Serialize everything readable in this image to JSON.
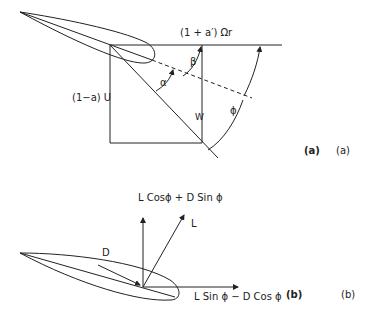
{
  "figure": {
    "panel_a": {
      "label_bold": "(a)",
      "label_plain": "(a)",
      "tangential_velocity": "(1 + a′) Ωr",
      "axial_velocity": "(1−a) U",
      "relative_velocity": "W",
      "angle_alpha": "α",
      "angle_beta": "β",
      "angle_phi": "ϕ"
    },
    "panel_b": {
      "label_bold": "(b)",
      "label_plain": "(b)",
      "axial_force": "L Cosϕ + D Sin ϕ",
      "lift": "L",
      "drag": "D",
      "tangential_force": "L Sin ϕ − D Cos ϕ"
    },
    "colors": {
      "stroke": "#222222",
      "background": "#ffffff"
    }
  }
}
